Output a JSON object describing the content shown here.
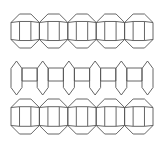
{
  "diagram": {
    "title": "",
    "background": "#ffffff",
    "line_color": "#555555",
    "rows": [
      {
        "name": "octagon-square-chain-top",
        "type": "octagon-chain",
        "units": 5,
        "x_start": 11,
        "x_end": 153,
        "y_top": 14,
        "y_bottom": 48,
        "inset_ratio": 0.3
      },
      {
        "name": "hexagon-square-chain-middle",
        "type": "hexagon-chain",
        "hexagons": 6,
        "squares": 5,
        "x_start": 11,
        "x_end": 153,
        "hex_width": 11,
        "y_top": 61,
        "y_bottom": 95,
        "square_top": 68,
        "square_bottom": 81
      },
      {
        "name": "octagon-square-chain-bottom",
        "type": "octagon-chain",
        "units": 5,
        "x_start": 11,
        "x_end": 153,
        "y_top": 99,
        "y_bottom": 134,
        "inset_ratio": 0.3
      }
    ]
  }
}
